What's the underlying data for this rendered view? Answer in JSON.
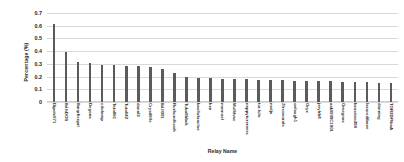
{
  "chart_data": {
    "type": "bar",
    "title": "",
    "xlabel": "Relay Name",
    "ylabel": "Percentage (%)",
    "ylim": [
      0,
      0.7
    ],
    "grid": true,
    "legend": "none",
    "bar_color": "#5b5b5b",
    "yticks": [
      "0",
      "0.1",
      "0.2",
      "0.3",
      "0.4",
      "0.5",
      "0.6",
      "0.7"
    ],
    "ytick_values": [
      0,
      0.1,
      0.2,
      0.3,
      0.4,
      0.5,
      0.6,
      0.7
    ],
    "categories": [
      "Dipolell71",
      "Ibl.hDOS",
      "lbnqrhcxprl",
      "Degona",
      "cdolomp",
      "Tatolllt1",
      "Tutoll42",
      "danal3",
      "Crystllllfe",
      "Ibl.ll001",
      "Rurhurnlluorh",
      "TuboIIbbck",
      "basllukrocloe",
      "ken",
      "mornoel",
      "Mulhlvac",
      "nappyturerners",
      "tur.lulo",
      "nadja",
      "Zlrconorols",
      "onlaugh1",
      "Oryx",
      "jerylrb8",
      "aakID00C1001",
      "Omegnas",
      "bearzino304",
      "lazuredibove",
      "danning",
      "TOR2DFNmA"
    ],
    "values": [
      0.617,
      0.395,
      0.315,
      0.305,
      0.288,
      0.288,
      0.285,
      0.283,
      0.272,
      0.262,
      0.232,
      0.195,
      0.188,
      0.185,
      0.182,
      0.18,
      0.178,
      0.175,
      0.172,
      0.17,
      0.168,
      0.166,
      0.164,
      0.162,
      0.16,
      0.158,
      0.156,
      0.15,
      0.148
    ]
  }
}
